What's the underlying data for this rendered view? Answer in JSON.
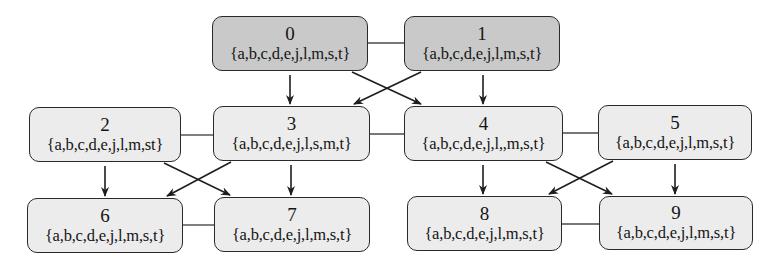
{
  "diagram": {
    "type": "directed graph",
    "colors": {
      "root_fill": "#c9c9c9",
      "node_fill": "#ececec",
      "stroke": "#2a2a2a",
      "background": "#ffffff"
    },
    "nodes": [
      {
        "id": "0",
        "set": "{a,b,c,d,e,j,l,m,s,t}",
        "style": "dark",
        "x": 212,
        "y": 16,
        "w": 156,
        "h": 55
      },
      {
        "id": "1",
        "set": "{a,b,c,d,e,j,l,m,s,t}",
        "style": "dark",
        "x": 404,
        "y": 16,
        "w": 156,
        "h": 55
      },
      {
        "id": "2",
        "set": "{a,b,c,d,e,j,l,m,st}",
        "style": "light",
        "x": 29,
        "y": 107,
        "w": 152,
        "h": 55
      },
      {
        "id": "3",
        "set": "{a,b,c,d,e,j,l,s,m,t}",
        "style": "light",
        "x": 213,
        "y": 106,
        "w": 157,
        "h": 55
      },
      {
        "id": "4",
        "set": "{a,b,c,d,e,j,l,,m,s,t}",
        "style": "light",
        "x": 404,
        "y": 106,
        "w": 159,
        "h": 55
      },
      {
        "id": "5",
        "set": "{a,b,c,d,e,j,l,m,s,t}",
        "style": "light",
        "x": 598,
        "y": 105,
        "w": 154,
        "h": 55
      },
      {
        "id": "6",
        "set": "{a,b,c,d,e,j,l,m,s,t}",
        "style": "light",
        "x": 27,
        "y": 198,
        "w": 156,
        "h": 55
      },
      {
        "id": "7",
        "set": "{a,b,c,d,e,j,l,m,s,t}",
        "style": "light",
        "x": 214,
        "y": 197,
        "w": 156,
        "h": 55
      },
      {
        "id": "8",
        "set": "{a,b,c,d,e,j,l,m,s,t}",
        "style": "light",
        "x": 407,
        "y": 196,
        "w": 155,
        "h": 55
      },
      {
        "id": "9",
        "set": "{a,b,c,d,e,j,l,m,s,t}",
        "style": "light",
        "x": 599,
        "y": 196,
        "w": 154,
        "h": 54
      }
    ],
    "undirected_edges": [
      {
        "from": "0",
        "to": "1",
        "x1": 368,
        "y1": 43,
        "x2": 404,
        "y2": 43
      },
      {
        "from": "2",
        "to": "3",
        "x1": 181,
        "y1": 135,
        "x2": 213,
        "y2": 135
      },
      {
        "from": "3",
        "to": "4",
        "x1": 370,
        "y1": 134,
        "x2": 404,
        "y2": 134
      },
      {
        "from": "4",
        "to": "5",
        "x1": 563,
        "y1": 133,
        "x2": 598,
        "y2": 133
      },
      {
        "from": "6",
        "to": "7",
        "x1": 183,
        "y1": 225,
        "x2": 214,
        "y2": 225
      },
      {
        "from": "8",
        "to": "9",
        "x1": 562,
        "y1": 224,
        "x2": 599,
        "y2": 224
      }
    ],
    "directed_edges": [
      {
        "from": "0",
        "to": "3",
        "x1": 290,
        "y1": 75,
        "x2": 290,
        "y2": 104
      },
      {
        "from": "0",
        "to": "4",
        "x1": 352,
        "y1": 72,
        "x2": 421,
        "y2": 104
      },
      {
        "from": "1",
        "to": "3",
        "x1": 421,
        "y1": 72,
        "x2": 354,
        "y2": 104
      },
      {
        "from": "1",
        "to": "4",
        "x1": 483,
        "y1": 75,
        "x2": 483,
        "y2": 104
      },
      {
        "from": "2",
        "to": "6",
        "x1": 105,
        "y1": 166,
        "x2": 105,
        "y2": 196
      },
      {
        "from": "2",
        "to": "7",
        "x1": 164,
        "y1": 163,
        "x2": 230,
        "y2": 195
      },
      {
        "from": "3",
        "to": "6",
        "x1": 231,
        "y1": 162,
        "x2": 167,
        "y2": 196
      },
      {
        "from": "3",
        "to": "7",
        "x1": 291,
        "y1": 165,
        "x2": 291,
        "y2": 195
      },
      {
        "from": "4",
        "to": "8",
        "x1": 483,
        "y1": 165,
        "x2": 483,
        "y2": 194
      },
      {
        "from": "4",
        "to": "9",
        "x1": 546,
        "y1": 162,
        "x2": 612,
        "y2": 194
      },
      {
        "from": "5",
        "to": "8",
        "x1": 613,
        "y1": 161,
        "x2": 549,
        "y2": 194
      },
      {
        "from": "5",
        "to": "9",
        "x1": 675,
        "y1": 164,
        "x2": 675,
        "y2": 194
      }
    ]
  }
}
